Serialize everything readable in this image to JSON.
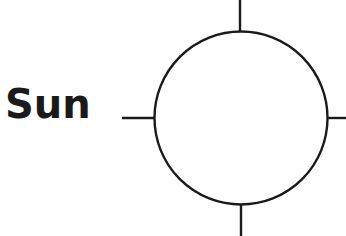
{
  "diagram": {
    "label": "Sun",
    "symbol": {
      "type": "circle-with-crosshair-ticks",
      "stroke_color": "#1a1a1a",
      "fill_color": "#ffffff",
      "center": [
        241,
        118
      ],
      "radius": 87
    }
  }
}
